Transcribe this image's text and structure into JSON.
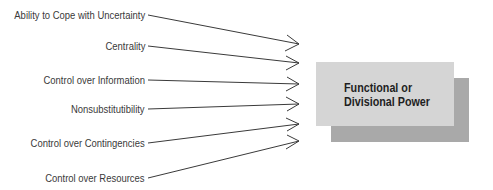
{
  "diagram": {
    "inputs": [
      {
        "label": "Ability to Cope with Uncertainty",
        "y": 15,
        "tip_y": 44
      },
      {
        "label": "Centrality",
        "y": 46,
        "tip_y": 63
      },
      {
        "label": "Control over Information",
        "y": 80,
        "tip_y": 84
      },
      {
        "label": "Nonsubstitutibility",
        "y": 109,
        "tip_y": 104
      },
      {
        "label": "Control over Contingencies",
        "y": 143,
        "tip_y": 124
      },
      {
        "label": "Control over Resources",
        "y": 178,
        "tip_y": 141
      }
    ],
    "target": {
      "line1": "Functional or",
      "line2": "Divisional Power"
    },
    "colors": {
      "box_front": "#d5d5d5",
      "box_shadow": "#a9a9a9",
      "line": "#3a3a3a"
    }
  }
}
